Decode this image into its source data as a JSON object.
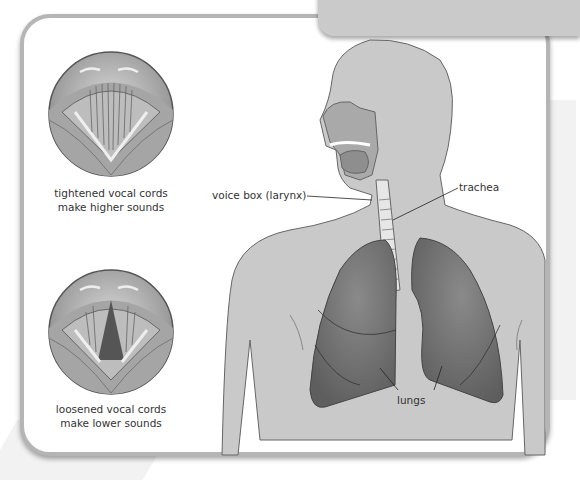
{
  "diagram": {
    "tab_text": "Vocal",
    "colors": {
      "frame_border": "#b5b5b5",
      "tab": "#cacaca",
      "body": "#c9c9c9",
      "lungs": "#6f6f6f",
      "outline": "#555555"
    },
    "vocal_cords": [
      {
        "id": "tightened",
        "caption_line1": "tightened vocal cords",
        "caption_line2": "make higher sounds"
      },
      {
        "id": "loosened",
        "caption_line1": "loosened vocal cords",
        "caption_line2": "make lower sounds"
      }
    ],
    "labels": {
      "larynx": "voice box (larynx)",
      "trachea": "trachea",
      "lungs": "lungs"
    }
  }
}
